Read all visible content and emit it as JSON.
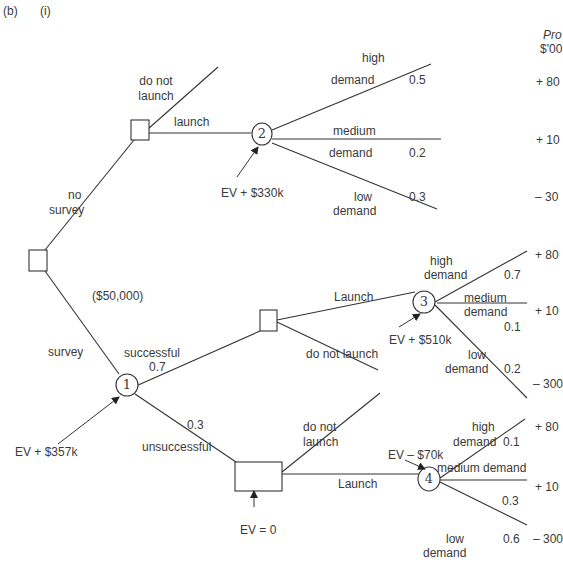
{
  "header": {
    "part": "(b)",
    "subpart": "(i)"
  },
  "profit_header": {
    "line1": "Pro",
    "line2": "$'00"
  },
  "nodes": {
    "root": {
      "type": "decision"
    },
    "d_no_survey": {
      "type": "decision"
    },
    "c1": {
      "type": "chance",
      "label": "1",
      "ev": "EV + $357k"
    },
    "c2": {
      "type": "chance",
      "label": "2",
      "ev": "EV + $330k"
    },
    "d_success": {
      "type": "decision"
    },
    "c3": {
      "type": "chance",
      "label": "3",
      "ev": "EV + $510k"
    },
    "d_unsuccess": {
      "type": "decision",
      "ev": "EV = 0"
    },
    "c4": {
      "type": "chance",
      "label": "4",
      "ev": "EV – $70k"
    }
  },
  "branches": {
    "no_survey": {
      "line1": "no",
      "line2": "survey"
    },
    "survey": {
      "label": "survey",
      "cost": "($50,000)"
    },
    "top_do_not_launch": {
      "line1": "do not",
      "line2": "launch"
    },
    "top_launch": {
      "label": "launch"
    },
    "successful": {
      "label": "successful",
      "prob": "0.7"
    },
    "unsuccessful": {
      "label": "unsuccessful",
      "prob": "0.3"
    },
    "succ_launch": {
      "label": "Launch"
    },
    "succ_do_not_launch": {
      "label": "do not launch"
    },
    "uns_do_not_launch": {
      "line1": "do not",
      "line2": "launch"
    },
    "uns_launch": {
      "label": "Launch"
    }
  },
  "outcomes": {
    "c2": {
      "high": {
        "line1": "high",
        "line2": "demand",
        "prob": "0.5",
        "profit": "+ 80"
      },
      "medium": {
        "line1": "medium",
        "line2": "demand",
        "prob": "0.2",
        "profit": "+ 10"
      },
      "low": {
        "line1": "low",
        "line2": "demand",
        "prob": "0.3",
        "profit": "– 30"
      }
    },
    "c3": {
      "high": {
        "line1": "high",
        "line2": "demand",
        "prob": "0.7",
        "profit": "+ 80"
      },
      "medium": {
        "line1": "medium",
        "line2": "demand",
        "prob": "0.1",
        "profit": "+ 10"
      },
      "low": {
        "line1": "low",
        "line2": "demand",
        "prob": "0.2",
        "profit": "– 300"
      }
    },
    "c4": {
      "high": {
        "line1": "high",
        "line2": "demand",
        "prob": "0.1",
        "profit": "+ 80"
      },
      "medium": {
        "label": "medium demand",
        "prob": "0.3",
        "profit": "+ 10"
      },
      "low": {
        "line1": "low",
        "line2": "demand",
        "prob": "0.6",
        "profit": "– 300"
      }
    }
  }
}
